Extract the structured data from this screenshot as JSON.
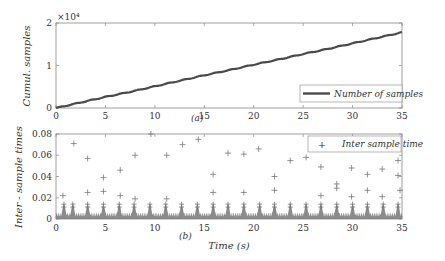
{
  "chart_data": [
    {
      "type": "line",
      "panel_label": "(a)",
      "title": "",
      "xlabel": "",
      "ylabel": "Cumul. samples",
      "y_exponent_label": "×10⁴",
      "xlim": [
        0,
        35
      ],
      "ylim": [
        0,
        2
      ],
      "xticks": [
        0,
        5,
        10,
        15,
        20,
        25,
        30,
        35
      ],
      "yticks": [
        0,
        1,
        2
      ],
      "grid": false,
      "legend_position": "lower right",
      "series": [
        {
          "name": "Number of samples",
          "color": "#555555",
          "x": [
            0,
            2.5,
            5,
            7.5,
            10,
            12.5,
            15,
            17.5,
            20,
            22.5,
            25,
            27.5,
            30,
            32.5,
            35
          ],
          "values": [
            0,
            0.13,
            0.26,
            0.38,
            0.51,
            0.64,
            0.77,
            0.89,
            1.02,
            1.14,
            1.27,
            1.39,
            1.52,
            1.65,
            1.78
          ]
        }
      ]
    },
    {
      "type": "scatter",
      "panel_label": "(b)",
      "title": "",
      "xlabel": "Time (s)",
      "ylabel": "Inter - sample times",
      "xlim": [
        0,
        35
      ],
      "ylim": [
        0,
        0.08
      ],
      "xticks": [
        0,
        5,
        10,
        15,
        20,
        25,
        30,
        35
      ],
      "yticks": [
        0,
        0.02,
        0.04,
        0.06,
        0.08
      ],
      "ytick_labels": [
        "0",
        "0.02",
        "0.04",
        "0.06",
        "0.08"
      ],
      "grid": false,
      "legend_position": "upper right",
      "marker": "+",
      "series": [
        {
          "name": "Inter sample time",
          "color": "#777777",
          "baseline_band": [
            0,
            0.006
          ],
          "peak_period_s": 1.57,
          "peak_x": [
            0.8,
            1.7,
            3.2,
            4.8,
            6.4,
            7.9,
            9.5,
            11.1,
            12.7,
            14.3,
            15.9,
            17.4,
            19.0,
            20.6,
            22.1,
            23.7,
            25.3,
            26.8,
            28.4,
            30.0,
            31.5,
            33.1,
            34.6
          ],
          "peak_y": 0.014,
          "outliers": [
            [
              0.7,
              0.022
            ],
            [
              1.8,
              0.071
            ],
            [
              3.2,
              0.057
            ],
            [
              3.2,
              0.025
            ],
            [
              4.8,
              0.039
            ],
            [
              4.8,
              0.026
            ],
            [
              6.5,
              0.046
            ],
            [
              6.5,
              0.022
            ],
            [
              8.0,
              0.06
            ],
            [
              8.0,
              0.019
            ],
            [
              9.6,
              0.08
            ],
            [
              11.2,
              0.06
            ],
            [
              11.2,
              0.019
            ],
            [
              12.8,
              0.07
            ],
            [
              14.4,
              0.075
            ],
            [
              15.9,
              0.042
            ],
            [
              15.9,
              0.025
            ],
            [
              17.4,
              0.062
            ],
            [
              19.0,
              0.061
            ],
            [
              19.0,
              0.025
            ],
            [
              20.5,
              0.066
            ],
            [
              22.1,
              0.04
            ],
            [
              22.1,
              0.027
            ],
            [
              23.7,
              0.055
            ],
            [
              25.3,
              0.058
            ],
            [
              26.8,
              0.049
            ],
            [
              26.8,
              0.022
            ],
            [
              28.4,
              0.033
            ],
            [
              28.4,
              0.029
            ],
            [
              29.9,
              0.048
            ],
            [
              29.9,
              0.021
            ],
            [
              31.5,
              0.042
            ],
            [
              31.5,
              0.027
            ],
            [
              33.0,
              0.047
            ],
            [
              33.0,
              0.021
            ],
            [
              34.6,
              0.055
            ],
            [
              34.6,
              0.041
            ],
            [
              34.8,
              0.027
            ]
          ]
        }
      ]
    }
  ]
}
